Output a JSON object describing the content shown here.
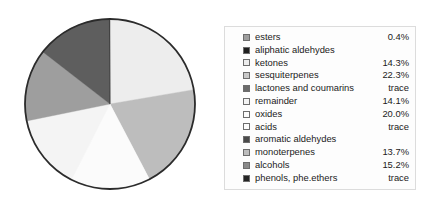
{
  "chart_data": {
    "type": "pie",
    "title": "",
    "legend_position": "right",
    "categories": [
      "esters",
      "aliphatic aldehydes",
      "ketones",
      "sesquiterpenes",
      "lactones and coumarins",
      "remainder",
      "oxides",
      "acids",
      "aromatic aldehydes",
      "monoterpenes",
      "alcohols",
      "phenols, phe.ethers"
    ],
    "value_labels": [
      "0.4%",
      "",
      "14.3%",
      "22.3%",
      "trace",
      "14.1%",
      "20.0%",
      "trace",
      "",
      "13.7%",
      "15.2%",
      "trace"
    ],
    "values": [
      0.4,
      0,
      14.3,
      22.3,
      0,
      14.1,
      20.0,
      0,
      0,
      13.7,
      15.2,
      0
    ],
    "colors": [
      "#9e9e9e",
      "#1f1f1f",
      "#ededed",
      "#c9c9c9",
      "#6b6b6b",
      "#f4f4f4",
      "#fbfbfb",
      "#fcfcfc",
      "#4a4a4a",
      "#bdbdbd",
      "#8a8a8a",
      "#242424"
    ],
    "slices": [
      {
        "label": "sesquiterpenes",
        "value": 22.3,
        "color": "#ededed",
        "start_deg": 0,
        "end_deg": 80.3
      },
      {
        "label": "oxides",
        "value": 20.0,
        "color": "#bdbdbd",
        "start_deg": 80.3,
        "end_deg": 152.3
      },
      {
        "label": "alcohols",
        "value": 15.2,
        "color": "#fbfbfb",
        "start_deg": 152.3,
        "end_deg": 207.0
      },
      {
        "label": "ketones",
        "value": 14.3,
        "color": "#f4f4f4",
        "start_deg": 207.0,
        "end_deg": 258.5
      },
      {
        "label": "monoterpenes",
        "value": 13.7,
        "color": "#9e9e9e",
        "start_deg": 258.5,
        "end_deg": 307.8
      },
      {
        "label": "remainder",
        "value": 14.1,
        "color": "#5e5e5e",
        "start_deg": 307.8,
        "end_deg": 359.6
      },
      {
        "label": "esters",
        "value": 0.4,
        "color": "#2a2a2a",
        "start_deg": 359.6,
        "end_deg": 360.0
      }
    ]
  },
  "style": {
    "outline": "#2b2b2b",
    "legend_border": "#dcdcdc",
    "text": "#1b1b1b"
  }
}
